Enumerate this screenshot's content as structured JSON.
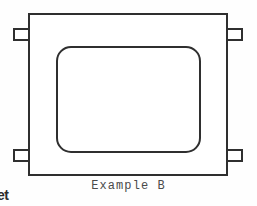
{
  "figure": {
    "caption": "Example B",
    "edge_text_fragment": "et",
    "line_color": "#2f2f2f",
    "fill_color": "#ffffff",
    "background_color": "#fefefe",
    "outer_frame": {
      "x": 29,
      "y": 14,
      "width": 198,
      "height": 161,
      "stroke_width": 2
    },
    "inner_cutout": {
      "x": 57,
      "y": 47,
      "width": 143,
      "height": 105,
      "corner_radius": 14,
      "stroke_width": 2
    },
    "tabs": [
      {
        "name": "top-left-tab",
        "x": 14,
        "y": 29,
        "width": 16,
        "height": 11
      },
      {
        "name": "top-right-tab",
        "x": 226,
        "y": 29,
        "width": 16,
        "height": 11
      },
      {
        "name": "bottom-left-tab",
        "x": 14,
        "y": 150,
        "width": 16,
        "height": 11
      },
      {
        "name": "bottom-right-tab",
        "x": 226,
        "y": 150,
        "width": 16,
        "height": 11
      }
    ]
  }
}
